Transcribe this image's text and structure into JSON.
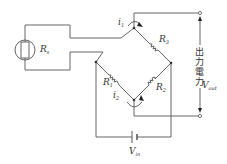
{
  "diagram": {
    "type": "wheatstone-bridge-circuit",
    "labels": {
      "sensor": {
        "main": "R",
        "sub": "s"
      },
      "i1": {
        "main": "i",
        "sub": "1"
      },
      "i2": {
        "main": "i",
        "sub": "2"
      },
      "r1": {
        "main": "R",
        "sub": "1"
      },
      "r2": {
        "main": "R",
        "sub": "2"
      },
      "r3": {
        "main": "R",
        "sub": "3"
      },
      "vin": {
        "main": "V",
        "sub": "in"
      },
      "vout": {
        "main": "V",
        "sub": "out"
      },
      "output_power": [
        "出",
        "力",
        "電",
        "力"
      ]
    },
    "colors": {
      "wire": "#555555",
      "text": "#333333"
    }
  }
}
